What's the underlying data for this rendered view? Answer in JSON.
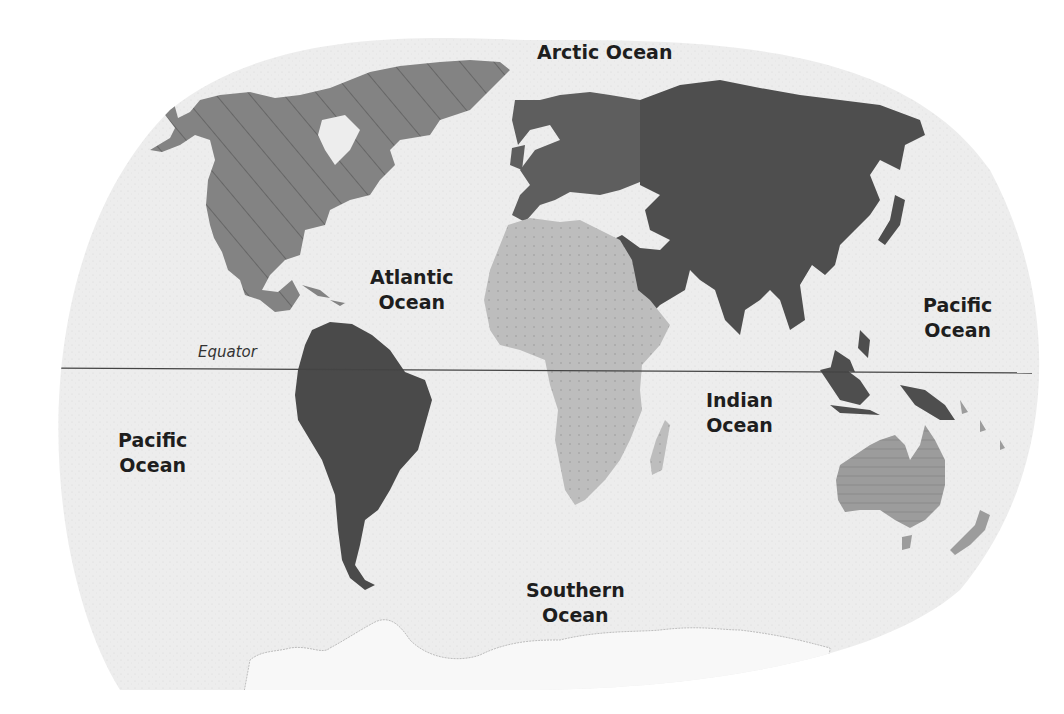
{
  "map": {
    "type": "world-continents-oceans",
    "colors": {
      "ocean": "#ededed",
      "background": "#ffffff",
      "north_america": "#838383",
      "south_america": "#4a4a4a",
      "europe": "#5e5e5e",
      "asia": "#4e4e4e",
      "africa": "#bcbcbc",
      "australia": "#9a9a9a",
      "antarctica": "#f6f6f6",
      "equator_line": "#444444",
      "label_text": "#1e1e1e"
    },
    "equator": {
      "label": "Equator"
    },
    "oceans": [
      {
        "id": "arctic",
        "line1": "Arctic Ocean",
        "line2": ""
      },
      {
        "id": "atlantic",
        "line1": "Atlantic",
        "line2": "Ocean"
      },
      {
        "id": "pacific-east",
        "line1": "Pacific",
        "line2": "Ocean"
      },
      {
        "id": "pacific-west",
        "line1": "Pacific",
        "line2": "Ocean"
      },
      {
        "id": "indian",
        "line1": "Indian",
        "line2": "Ocean"
      },
      {
        "id": "southern",
        "line1": "Southern",
        "line2": "Ocean"
      }
    ],
    "continents": [
      {
        "id": "north-america",
        "fill": "hatched-diagonal"
      },
      {
        "id": "south-america",
        "fill": "solid-dark"
      },
      {
        "id": "europe",
        "fill": "solid"
      },
      {
        "id": "asia",
        "fill": "solid-dark"
      },
      {
        "id": "africa",
        "fill": "dotted-light"
      },
      {
        "id": "australia",
        "fill": "hatched-horizontal"
      },
      {
        "id": "antarctica",
        "fill": "faint"
      }
    ]
  }
}
